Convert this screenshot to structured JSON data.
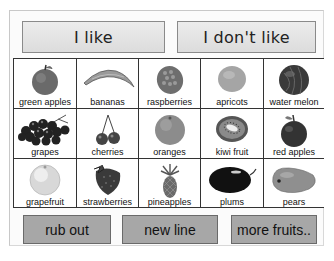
{
  "header": {
    "like_label": "I like",
    "dont_like_label": "I don't like"
  },
  "fruits": [
    {
      "label": "green apples",
      "icon": "green-apple-icon",
      "color": "#6a6a6a"
    },
    {
      "label": "bananas",
      "icon": "banana-icon",
      "color": "#8a8a8a"
    },
    {
      "label": "raspberries",
      "icon": "raspberry-icon",
      "color": "#6e6e6e"
    },
    {
      "label": "apricots",
      "icon": "apricot-icon",
      "color": "#a5a5a5"
    },
    {
      "label": "water melon",
      "icon": "watermelon-icon",
      "color": "#3a3a3a"
    },
    {
      "label": "grapes",
      "icon": "grapes-icon",
      "color": "#222222"
    },
    {
      "label": "cherries",
      "icon": "cherries-icon",
      "color": "#444444"
    },
    {
      "label": "oranges",
      "icon": "orange-icon",
      "color": "#8c8c8c"
    },
    {
      "label": "kiwi fruit",
      "icon": "kiwi-icon",
      "color": "#7a7a7a"
    },
    {
      "label": "red apples",
      "icon": "red-apple-icon",
      "color": "#333333"
    },
    {
      "label": "grapefruit",
      "icon": "grapefruit-icon",
      "color": "#d8d8d8"
    },
    {
      "label": "strawberries",
      "icon": "strawberry-icon",
      "color": "#3a3a3a"
    },
    {
      "label": "pineapples",
      "icon": "pineapple-icon",
      "color": "#6a6a6a"
    },
    {
      "label": "plums",
      "icon": "plum-icon",
      "color": "#111111"
    },
    {
      "label": "pears",
      "icon": "pear-icon",
      "color": "#8f8f8f"
    }
  ],
  "footer": {
    "rub_out_label": "rub out",
    "new_line_label": "new line",
    "more_fruits_label": "more fruits.."
  }
}
